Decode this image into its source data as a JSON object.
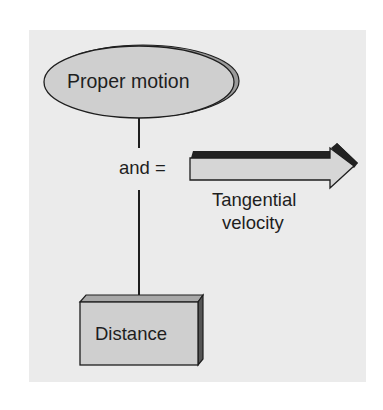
{
  "diagram": {
    "nodes": [
      {
        "id": "proper-motion",
        "shape": "ellipse",
        "label": "Proper motion"
      },
      {
        "id": "distance",
        "shape": "box",
        "label": "Distance"
      },
      {
        "id": "tangential-velocity",
        "shape": "arrow",
        "label_line1": "Tangential",
        "label_line2": "velocity"
      }
    ],
    "connector_label": "and =",
    "colors": {
      "background": "#ebebeb",
      "node_fill": "#cfcfcf",
      "node_shadow": "#9a9a9a",
      "arrow_fill": "#d6d6d6",
      "arrow_bevel": "#222222",
      "stroke": "#1e1e1e"
    }
  }
}
